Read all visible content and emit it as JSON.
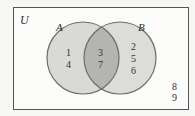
{
  "diagram": {
    "type": "venn",
    "universe_label": "U",
    "sets": [
      {
        "name": "A",
        "only": [
          "1",
          "4"
        ]
      },
      {
        "name": "B",
        "only": [
          "2",
          "5",
          "6"
        ]
      }
    ],
    "intersection": [
      "3",
      "7"
    ],
    "outside": [
      "8",
      "9"
    ],
    "colors": {
      "background": "#f6f6f4",
      "circle_fill": "#d9d9d6",
      "intersection_fill": "#b4b4b1",
      "stroke": "#6e6e6e",
      "frame": "#555555"
    }
  }
}
